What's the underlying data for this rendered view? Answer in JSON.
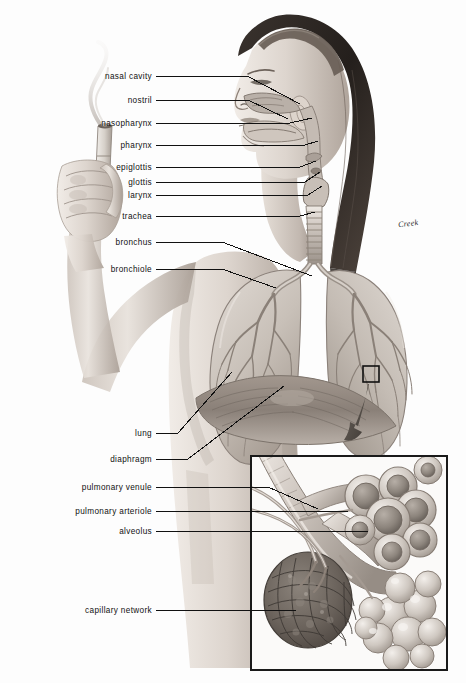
{
  "figure": {
    "background_color": "#fdfdfd",
    "ink_color": "#111111"
  },
  "signature": {
    "text": "Creek",
    "x": 398,
    "y": 219
  },
  "labels": [
    {
      "id": "nasal-cavity",
      "text": "nasal cavity",
      "text_right": 152,
      "y": 76,
      "path": "M156,76 L247,76 L300,104"
    },
    {
      "id": "nostril",
      "text": "nostril",
      "text_right": 152,
      "y": 100,
      "path": "M156,100 L248,100 L288,119"
    },
    {
      "id": "nasopharynx",
      "text": "nasopharynx",
      "text_right": 152,
      "y": 123,
      "path": "M156,123 L290,123 L312,118"
    },
    {
      "id": "pharynx",
      "text": "pharynx",
      "text_right": 152,
      "y": 145,
      "path": "M156,145 L305,145 L318,141"
    },
    {
      "id": "epiglottis",
      "text": "epiglottis",
      "text_right": 152,
      "y": 167,
      "path": "M156,167 L300,167 L316,161"
    },
    {
      "id": "glottis",
      "text": "glottis",
      "text_right": 152,
      "y": 182,
      "path": "M156,182 L305,182 L320,172"
    },
    {
      "id": "larynx",
      "text": "larynx",
      "text_right": 152,
      "y": 195,
      "path": "M156,195 L308,195 L322,186"
    },
    {
      "id": "trachea",
      "text": "trachea",
      "text_right": 152,
      "y": 216,
      "path": "M156,216 L300,216 L315,212"
    },
    {
      "id": "bronchus",
      "text": "bronchus",
      "text_right": 152,
      "y": 242,
      "path": "M156,242 L222,242 L312,276"
    },
    {
      "id": "bronchiole",
      "text": "bronchiole",
      "text_right": 152,
      "y": 269,
      "path": "M156,269 L222,269 L276,288"
    },
    {
      "id": "lung",
      "text": "lung",
      "text_right": 152,
      "y": 433,
      "path": "M156,433 L178,433 L232,372"
    },
    {
      "id": "diaphragm",
      "text": "diaphragm",
      "text_right": 152,
      "y": 459,
      "path": "M156,459 L188,459 L284,386"
    },
    {
      "id": "pulmonary-venule",
      "text": "pulmonary venule",
      "text_right": 152,
      "y": 487,
      "path": "M156,487 L268,487 L318,509"
    },
    {
      "id": "pulmonary-arteriole",
      "text": "pulmonary arteriole",
      "text_right": 152,
      "y": 511,
      "path": "M156,511 L348,511"
    },
    {
      "id": "alveolus",
      "text": "alveolus",
      "text_right": 152,
      "y": 531,
      "path": "M156,531 L368,531"
    },
    {
      "id": "capillary-network",
      "text": "capillary network",
      "text_right": 152,
      "y": 610,
      "path": "M156,610 L296,610"
    }
  ],
  "inset": {
    "name": "alveoli-detail-box",
    "x": 251,
    "y": 456,
    "width": 196,
    "height": 214,
    "border_color": "#1a1a1a",
    "contents": [
      "bronchiole",
      "alveolar sacs",
      "capillary network",
      "pulmonary arteriole",
      "pulmonary venule"
    ]
  },
  "callout": {
    "name": "callout-square",
    "x": 363,
    "y": 366,
    "width": 16,
    "height": 16,
    "arrow_tip_x": 352,
    "arrow_tip_y": 437
  },
  "palette": {
    "skin_light": "#e9e3de",
    "skin_mid": "#cfc6bf",
    "skin_shadow": "#a79c94",
    "hair_dark": "#2a2522",
    "hair_mid": "#4b423c",
    "lung_light": "#dcd6d0",
    "lung_mid": "#bdb4ad",
    "lung_vessel": "#8d8279",
    "airway": "#c9c1ba",
    "alveoli_light": "#d8d2cc",
    "alveoli_dark": "#8e867e",
    "capillary": "#6e665f"
  }
}
